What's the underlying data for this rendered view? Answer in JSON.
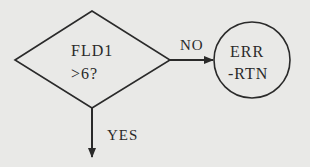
{
  "diagram": {
    "type": "flowchart",
    "nodes": [
      {
        "id": "decision",
        "shape": "diamond",
        "lines": [
          "FLD1",
          ">6?"
        ]
      },
      {
        "id": "err",
        "shape": "circle",
        "lines": [
          "ERR",
          "-RTN"
        ]
      }
    ],
    "edges": [
      {
        "from": "decision",
        "to": "err",
        "label": "NO",
        "direction": "right"
      },
      {
        "from": "decision",
        "to": "next",
        "label": "YES",
        "direction": "down"
      }
    ],
    "colors": {
      "background": "#e9e9e7",
      "stroke": "#2a2a2a"
    }
  }
}
